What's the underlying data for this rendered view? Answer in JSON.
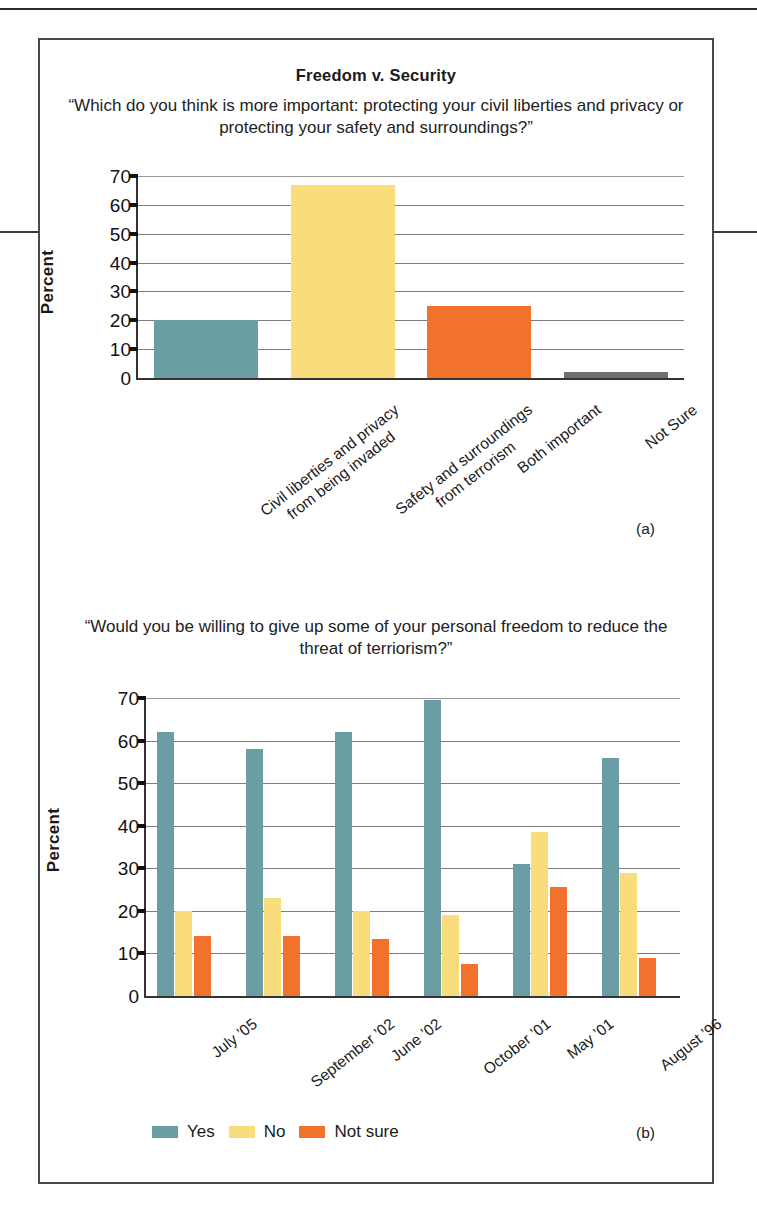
{
  "figure": {
    "title": "Freedom v. Security",
    "panel_a_tag": "(a)",
    "panel_b_tag": "(b)"
  },
  "colors": {
    "teal": "#6a9ea4",
    "yellow": "#f9dd7c",
    "orange": "#f2712c",
    "gray": "#6e6e6e",
    "axis": "#333333",
    "grid": "#7d7d7d",
    "border": "#4a4a4a"
  },
  "chart_data": [
    {
      "type": "bar",
      "panel": "(a)",
      "title": "Freedom v. Security",
      "subtitle": "“Which do you think is more important: protecting your civil liberties and privacy or protecting your safety and surroundings?”",
      "xlabel": "",
      "ylabel": "Percent",
      "ylim": [
        0,
        70
      ],
      "yticks": [
        0,
        10,
        20,
        30,
        40,
        50,
        60,
        70
      ],
      "ytick_labels": [
        "0",
        "10",
        "20",
        "30",
        "40",
        "50",
        "60",
        "70"
      ],
      "grid": true,
      "legend": "none",
      "categories": [
        "Civil liberties and privacy\nfrom being invaded",
        "Safety and surroundings\nfrom terrorism",
        "Both important",
        "Not Sure"
      ],
      "category_lines": [
        [
          "Civil liberties and privacy",
          "from being invaded"
        ],
        [
          "Safety and surroundings",
          "from terrorism"
        ],
        [
          "Both important"
        ],
        [
          "Not Sure"
        ]
      ],
      "values": [
        20,
        67,
        25,
        2
      ],
      "bar_colors": [
        "#6a9ea4",
        "#f9dd7c",
        "#f2712c",
        "#6e6e6e"
      ]
    },
    {
      "type": "bar",
      "panel": "(b)",
      "title": "",
      "subtitle": "“Would you be willing to give up some of your personal freedom to reduce the threat of terriorism?”",
      "xlabel": "",
      "ylabel": "Percent",
      "ylim": [
        0,
        70
      ],
      "yticks": [
        0,
        10,
        20,
        30,
        40,
        50,
        60,
        70
      ],
      "ytick_labels": [
        "0",
        "10",
        "20",
        "30",
        "40",
        "50",
        "60",
        "70"
      ],
      "grid": true,
      "legend_position": "bottom-left",
      "categories": [
        "July ’05",
        "September ’02",
        "June ’02",
        "October ’01",
        "May ’01",
        "August ’96"
      ],
      "series": [
        {
          "name": "Yes",
          "color": "#6a9ea4",
          "values": [
            62,
            58,
            62,
            69.5,
            31,
            56
          ]
        },
        {
          "name": "No",
          "color": "#f9dd7c",
          "values": [
            20,
            23,
            20,
            19,
            38.5,
            29
          ]
        },
        {
          "name": "Not sure",
          "color": "#f2712c",
          "values": [
            14,
            14,
            13.5,
            7.5,
            25.5,
            9
          ]
        }
      ]
    }
  ]
}
